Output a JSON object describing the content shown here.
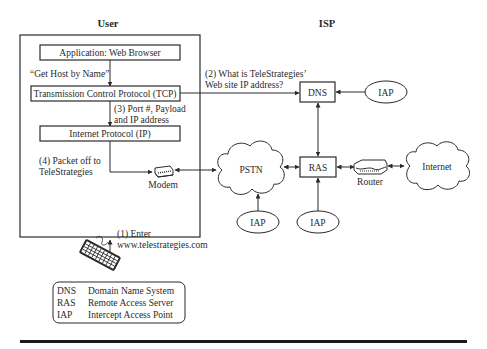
{
  "headers": {
    "user": "User",
    "isp": "ISP"
  },
  "user_stack": {
    "application": "Application: Web Browser",
    "get_host": "“Get Host by Name”",
    "tcp": "Transmission Control Protocol (TCP)",
    "step3_line1": "(3) Port #, Payload",
    "step3_line2": "and IP address",
    "ip": "Internet Protocol (IP)",
    "step4_line1": "(4) Packet off to",
    "step4_line2": "TeleStrategies",
    "modem": "Modem"
  },
  "step1": {
    "line1": "(1) Enter",
    "line2": "www.telestrategies.com"
  },
  "step2": {
    "line1": "(2) What is TeleStrategies’",
    "line2": "Web site IP address?"
  },
  "isp_nodes": {
    "dns": "DNS",
    "ras": "RAS",
    "pstn": "PSTN",
    "internet": "Internet",
    "router": "Router",
    "iap_dns": "IAP",
    "iap_pstn": "IAP",
    "iap_ras": "IAP"
  },
  "legend": [
    {
      "abbr": "DNS",
      "meaning": "Domain Name System"
    },
    {
      "abbr": "RAS",
      "meaning": "Remote Access Server"
    },
    {
      "abbr": "IAP",
      "meaning": "Intercept Access Point"
    }
  ],
  "icons": {
    "modem": "modem-icon",
    "router": "router-icon",
    "keyboard": "keyboard-icon",
    "cloud": "cloud-icon"
  }
}
